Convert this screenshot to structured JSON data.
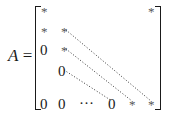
{
  "equation": {
    "lhs": "A",
    "equals": "=",
    "matrix": {
      "entries": [
        {
          "id": "r1c1",
          "text": "*",
          "x": 41,
          "y": 4
        },
        {
          "id": "r1cn",
          "text": "*",
          "x": 148,
          "y": 4
        },
        {
          "id": "r2c1",
          "text": "*",
          "x": 41,
          "y": 24
        },
        {
          "id": "r2c2",
          "text": "*",
          "x": 61,
          "y": 24
        },
        {
          "id": "r3c1",
          "text": "0",
          "x": 40,
          "y": 43
        },
        {
          "id": "r3c2",
          "text": "*",
          "x": 61,
          "y": 43
        },
        {
          "id": "r4c2",
          "text": "0",
          "x": 58,
          "y": 64
        },
        {
          "id": "rnc1",
          "text": "0",
          "x": 40,
          "y": 97
        },
        {
          "id": "rnc2",
          "text": "0",
          "x": 58,
          "y": 97
        },
        {
          "id": "rn_dots",
          "text": "···",
          "x": 79,
          "y": 96
        },
        {
          "id": "rn_0",
          "text": "0",
          "x": 108,
          "y": 97
        },
        {
          "id": "rn_star1",
          "text": "*",
          "x": 129,
          "y": 97
        },
        {
          "id": "rnn",
          "text": "*",
          "x": 148,
          "y": 97
        }
      ],
      "diagonals": [
        {
          "id": "upper-diagonal",
          "from": [
            66,
            30
          ],
          "to": [
            151,
            101
          ]
        },
        {
          "id": "main-diagonal",
          "from": [
            66,
            49
          ],
          "to": [
            132,
            101
          ]
        },
        {
          "id": "lower-diagonal",
          "from": [
            64,
            70
          ],
          "to": [
            112,
            101
          ]
        }
      ]
    }
  }
}
